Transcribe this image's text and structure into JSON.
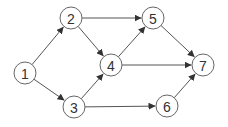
{
  "diagram": {
    "type": "directed-graph",
    "node_radius": 11,
    "colors": {
      "edge": "#555555",
      "node_stroke": "#666666",
      "node_fill": "#ffffff",
      "label": "#333333"
    },
    "nodes": [
      {
        "id": "1",
        "label": "1",
        "x": 25,
        "y": 73
      },
      {
        "id": "2",
        "label": "2",
        "x": 71,
        "y": 18
      },
      {
        "id": "3",
        "label": "3",
        "x": 74,
        "y": 107
      },
      {
        "id": "4",
        "label": "4",
        "x": 111,
        "y": 65
      },
      {
        "id": "5",
        "label": "5",
        "x": 153,
        "y": 18
      },
      {
        "id": "6",
        "label": "6",
        "x": 167,
        "y": 106
      },
      {
        "id": "7",
        "label": "7",
        "x": 203,
        "y": 65
      }
    ],
    "edges": [
      {
        "from": "1",
        "to": "2"
      },
      {
        "from": "1",
        "to": "3"
      },
      {
        "from": "2",
        "to": "5"
      },
      {
        "from": "2",
        "to": "4"
      },
      {
        "from": "3",
        "to": "4"
      },
      {
        "from": "3",
        "to": "6"
      },
      {
        "from": "4",
        "to": "5"
      },
      {
        "from": "4",
        "to": "7"
      },
      {
        "from": "5",
        "to": "7"
      },
      {
        "from": "6",
        "to": "7"
      }
    ]
  }
}
